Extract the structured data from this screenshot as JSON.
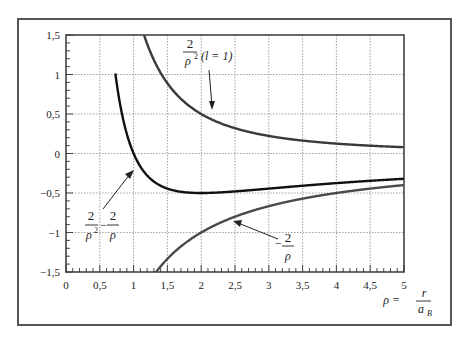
{
  "chart_data": {
    "type": "line",
    "title": "",
    "xlabel": "ρ = r / a_B",
    "ylabel": "",
    "xlim": [
      0,
      5
    ],
    "ylim": [
      -1.5,
      1.5
    ],
    "grid": true,
    "x_ticks": [
      "0",
      "0,5",
      "1",
      "1,5",
      "2",
      "2,5",
      "3",
      "3,5",
      "4",
      "4,5",
      "5"
    ],
    "y_ticks": [
      "1,5",
      "1",
      "0,5",
      "0",
      "-0,5",
      "-1",
      "-1,5"
    ],
    "series": [
      {
        "name": "2/ρ² (l = 1)",
        "formula": "2/rho^2",
        "color": "#3a3a3a",
        "x": [
          1.155,
          1.5,
          2,
          2.5,
          3,
          3.5,
          4,
          4.5,
          5
        ],
        "values": [
          1.5,
          0.889,
          0.5,
          0.32,
          0.222,
          0.163,
          0.125,
          0.099,
          0.08
        ]
      },
      {
        "name": "2/ρ² − 2/ρ",
        "formula": "2/rho^2-2/rho",
        "color": "#111111",
        "x": [
          0.73,
          0.8,
          1,
          1.5,
          2,
          2.5,
          3,
          3.5,
          4,
          4.5,
          5
        ],
        "values": [
          1.5,
          0.625,
          0,
          -0.444,
          -0.5,
          -0.48,
          -0.444,
          -0.408,
          -0.375,
          -0.346,
          -0.32
        ]
      },
      {
        "name": "−2/ρ",
        "formula": "-2/rho",
        "color": "#4a4a4a",
        "x": [
          1.333,
          1.5,
          2,
          2.5,
          3,
          3.5,
          4,
          4.5,
          5
        ],
        "values": [
          -1.5,
          -1.333,
          -1.0,
          -0.8,
          -0.667,
          -0.571,
          -0.5,
          -0.444,
          -0.4
        ]
      }
    ],
    "annotations": [
      {
        "text": "2/ρ² (l = 1)",
        "points_to": "2/ρ²"
      },
      {
        "text": "2/ρ² − 2/ρ",
        "points_to": "2/ρ² − 2/ρ"
      },
      {
        "text": "−2/ρ",
        "points_to": "−2/ρ"
      }
    ]
  },
  "labels": {
    "ann1_num": "2",
    "ann1_den": "ρ",
    "ann1_sup": "2",
    "ann1_extra": "(l = 1)",
    "ann2_num1": "2",
    "ann2_den1": "ρ",
    "ann2_sup1": "2",
    "ann2_minus": "−",
    "ann2_num2": "2",
    "ann2_den2": "ρ",
    "ann3_minus": "−",
    "ann3_num": "2",
    "ann3_den": "ρ",
    "xlabel_rho": "ρ =",
    "xlabel_num": "r",
    "xlabel_den": "a",
    "xlabel_sub": "B"
  }
}
